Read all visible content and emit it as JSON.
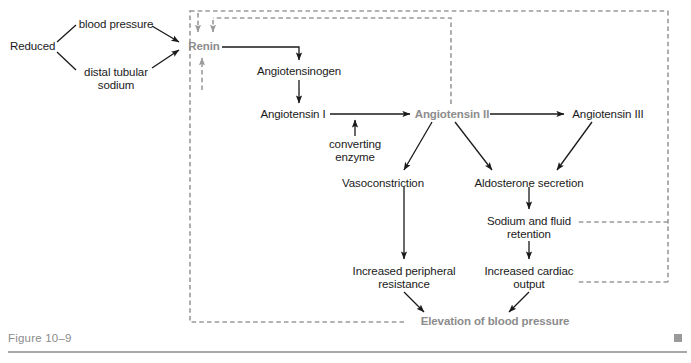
{
  "figure": {
    "caption": "Figure 10–9",
    "marker_icon": "square-marker-icon"
  },
  "colors": {
    "accent_gray": "#8c8c8c",
    "text_black": "#1a1a1a",
    "arrow_black": "#1a1a1a",
    "dashed_gray": "#9a9a9a",
    "rule_gray": "#a8a8a8"
  },
  "diagram": {
    "type": "flowchart",
    "nodes": [
      {
        "id": "reduced",
        "label": "Reduced",
        "x": 10,
        "y": 40,
        "style": "plain"
      },
      {
        "id": "blood_pressure",
        "label": "blood pressure",
        "x": 78,
        "y": 18,
        "style": "plain"
      },
      {
        "id": "distal_sodium",
        "label": "distal tubular\nsodium",
        "x": 78,
        "y": 66,
        "style": "plain"
      },
      {
        "id": "renin",
        "label": "Renin",
        "x": 184,
        "y": 40,
        "style": "accent"
      },
      {
        "id": "angiotensinogen",
        "label": "Angiotensinogen",
        "x": 255,
        "y": 65,
        "style": "plain"
      },
      {
        "id": "angiotensin_i",
        "label": "Angiotensin I",
        "x": 259,
        "y": 109,
        "style": "plain"
      },
      {
        "id": "converting_enzyme",
        "label": "converting\nenzyme",
        "x": 317,
        "y": 138,
        "style": "plain"
      },
      {
        "id": "angiotensin_ii",
        "label": "Angiotensin II",
        "x": 416,
        "y": 109,
        "style": "accent"
      },
      {
        "id": "angiotensin_iii",
        "label": "Angiotensin III",
        "x": 570,
        "y": 109,
        "style": "plain"
      },
      {
        "id": "vasoconstriction",
        "label": "Vasoconstriction",
        "x": 339,
        "y": 177,
        "style": "plain"
      },
      {
        "id": "aldosterone",
        "label": "Aldosterone secretion",
        "x": 470,
        "y": 177,
        "style": "plain"
      },
      {
        "id": "sodium_retention",
        "label": "Sodium and fluid\nretention",
        "x": 486,
        "y": 215,
        "style": "plain"
      },
      {
        "id": "peripheral_resist",
        "label": "Increased peripheral\nresistance",
        "x": 347,
        "y": 265,
        "style": "plain"
      },
      {
        "id": "cardiac_output",
        "label": "Increased cardiac\noutput",
        "x": 482,
        "y": 265,
        "style": "plain"
      },
      {
        "id": "elevation_bp",
        "label": "Elevation of blood pressure",
        "x": 422,
        "y": 315,
        "style": "accent"
      }
    ],
    "edges": [
      {
        "from": "reduced",
        "to": "blood_pressure",
        "kind": "line"
      },
      {
        "from": "reduced",
        "to": "distal_sodium",
        "kind": "line"
      },
      {
        "from": "blood_pressure",
        "to": "renin",
        "kind": "arrow"
      },
      {
        "from": "distal_sodium",
        "to": "renin",
        "kind": "arrow"
      },
      {
        "from": "renin",
        "to": "angiotensinogen",
        "kind": "arrow"
      },
      {
        "from": "angiotensinogen",
        "to": "angiotensin_i",
        "kind": "arrow"
      },
      {
        "from": "angiotensin_i",
        "to": "angiotensin_ii",
        "kind": "arrow"
      },
      {
        "from": "converting_enzyme",
        "to": "angiotensin_i_ii",
        "kind": "arrow"
      },
      {
        "from": "angiotensin_ii",
        "to": "angiotensin_iii",
        "kind": "arrow"
      },
      {
        "from": "angiotensin_ii",
        "to": "vasoconstriction",
        "kind": "arrow"
      },
      {
        "from": "angiotensin_ii",
        "to": "aldosterone",
        "kind": "arrow"
      },
      {
        "from": "angiotensin_iii",
        "to": "aldosterone",
        "kind": "arrow"
      },
      {
        "from": "aldosterone",
        "to": "sodium_retention",
        "kind": "arrow"
      },
      {
        "from": "vasoconstriction",
        "to": "peripheral_resist",
        "kind": "arrow"
      },
      {
        "from": "sodium_retention",
        "to": "cardiac_output",
        "kind": "arrow"
      },
      {
        "from": "peripheral_resist",
        "to": "elevation_bp",
        "kind": "arrow"
      },
      {
        "from": "cardiac_output",
        "to": "elevation_bp",
        "kind": "arrow"
      },
      {
        "from": "elevation_bp",
        "to": "renin",
        "kind": "feedback-dashed"
      },
      {
        "from": "sodium_retention",
        "to": "renin",
        "kind": "feedback-dashed"
      },
      {
        "from": "cardiac_output",
        "to": "renin",
        "kind": "feedback-dashed"
      },
      {
        "from": "angiotensin_ii",
        "to": "renin",
        "kind": "feedback-dashed"
      }
    ]
  }
}
